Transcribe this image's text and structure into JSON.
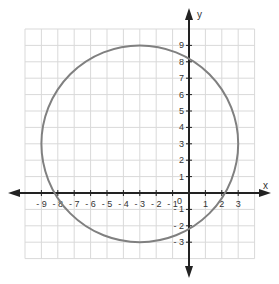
{
  "chart_data": {
    "type": "line",
    "title": "",
    "xlabel": "x",
    "ylabel": "y",
    "xlim": [
      -10,
      4
    ],
    "ylim": [
      -4,
      10
    ],
    "grid": true,
    "x_tick_labels": [
      "-9",
      "-8",
      "-7",
      "-6",
      "-5",
      "-4",
      "-3",
      "-2",
      "-1",
      "1",
      "2",
      "3"
    ],
    "y_tick_labels": [
      "9",
      "8",
      "7",
      "6",
      "5",
      "4",
      "3",
      "2",
      "1",
      "-1",
      "-2",
      "-3"
    ],
    "origin_label": "0",
    "series": [
      {
        "name": "circle",
        "shape": "circle",
        "center": [
          -3,
          3
        ],
        "radius": 6,
        "equation": "(x+3)^2 + (y-3)^2 = 36",
        "color": "#808080",
        "key_points": {
          "top": [
            -3,
            9
          ],
          "bottom": [
            -3,
            -3
          ],
          "left": [
            -9,
            3
          ],
          "right": [
            3,
            3
          ],
          "x_intercepts": [
            -8.2,
            2.2
          ],
          "y_intercepts": [
            8.2,
            -2.2
          ]
        }
      }
    ]
  },
  "colors": {
    "grid": "#d9d9d9",
    "axis": "#222222",
    "curve": "#808080"
  }
}
